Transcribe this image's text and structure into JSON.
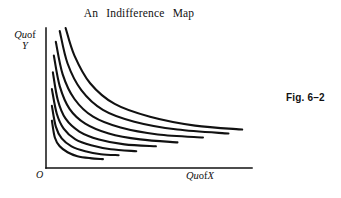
{
  "figure": {
    "title": "An  Indifference  Map",
    "caption": "Fig. 6–2",
    "origin_label": "O",
    "y_axis_label_prefix": "Qu",
    "y_axis_label_middle": "of",
    "y_axis_label_variable": "Y",
    "x_axis_label_prefix": "Qu",
    "x_axis_label_middle": "of",
    "x_axis_label_variable": "X",
    "line_color": "#111111",
    "background_color": "#ffffff"
  },
  "chart_data": {
    "type": "line",
    "title": "An  Indifference Map",
    "xlabel": "Qu of X",
    "ylabel": "Qu of Y",
    "grid": false,
    "legend": "none",
    "axis_style": "two-axis-corner",
    "xlim": [
      0,
      210
    ],
    "ylim": [
      0,
      142
    ],
    "axes": {
      "origin_px": [
        46,
        168
      ],
      "y_axis_top_px": [
        46,
        28
      ],
      "x_axis_right_px": [
        252,
        168
      ],
      "stroke_width": 1.4
    },
    "series": [
      {
        "name": "IC1",
        "utility_rank": 1,
        "points": [
          [
            6,
            48
          ],
          [
            9,
            31
          ],
          [
            14,
            22
          ],
          [
            22,
            16
          ],
          [
            32,
            12
          ],
          [
            45,
            10
          ],
          [
            58,
            9
          ]
        ]
      },
      {
        "name": "IC2",
        "utility_rank": 2,
        "points": [
          [
            6,
            63
          ],
          [
            10,
            42
          ],
          [
            16,
            30
          ],
          [
            26,
            22
          ],
          [
            40,
            17
          ],
          [
            56,
            14
          ],
          [
            74,
            13
          ]
        ]
      },
      {
        "name": "IC3",
        "utility_rank": 3,
        "points": [
          [
            6,
            80
          ],
          [
            11,
            55
          ],
          [
            18,
            40
          ],
          [
            30,
            29
          ],
          [
            46,
            23
          ],
          [
            66,
            19
          ],
          [
            92,
            17
          ]
        ]
      },
      {
        "name": "IC4",
        "utility_rank": 4,
        "points": [
          [
            7,
            97
          ],
          [
            12,
            69
          ],
          [
            20,
            50
          ],
          [
            34,
            37
          ],
          [
            54,
            29
          ],
          [
            80,
            24
          ],
          [
            112,
            22
          ]
        ]
      },
      {
        "name": "IC5",
        "utility_rank": 5,
        "points": [
          [
            8,
            114
          ],
          [
            14,
            83
          ],
          [
            24,
            60
          ],
          [
            40,
            45
          ],
          [
            64,
            35
          ],
          [
            96,
            29
          ],
          [
            134,
            26
          ]
        ]
      },
      {
        "name": "IC6",
        "utility_rank": 6,
        "points": [
          [
            10,
            128
          ],
          [
            17,
            95
          ],
          [
            29,
            70
          ],
          [
            48,
            52
          ],
          [
            76,
            41
          ],
          [
            114,
            34
          ],
          [
            160,
            31
          ]
        ]
      },
      {
        "name": "IC7",
        "utility_rank": 7,
        "points": [
          [
            14,
            139
          ],
          [
            22,
            106
          ],
          [
            36,
            79
          ],
          [
            58,
            59
          ],
          [
            90,
            47
          ],
          [
            134,
            39
          ],
          [
            186,
            35
          ]
        ]
      },
      {
        "name": "IC8",
        "utility_rank": 8,
        "points": [
          [
            20,
            142
          ],
          [
            29,
            114
          ],
          [
            45,
            86
          ],
          [
            70,
            65
          ],
          [
            106,
            52
          ],
          [
            152,
            43
          ],
          [
            200,
            39
          ]
        ]
      }
    ]
  }
}
